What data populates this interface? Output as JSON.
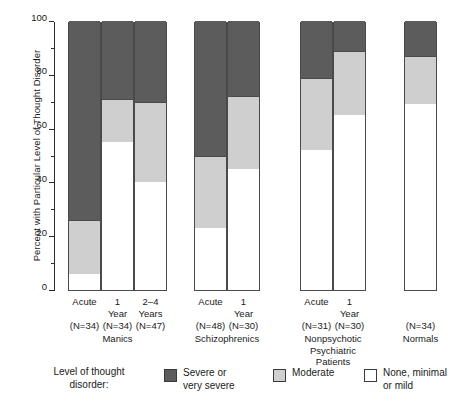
{
  "chart_data": {
    "type": "bar",
    "subtype": "stacked-100-percent",
    "title": "",
    "xlabel": "",
    "ylabel": "Percent with Particular Level of Thought Disorder",
    "ylim": [
      0,
      100
    ],
    "ytick_labels": [
      "0",
      "20",
      "40",
      "60",
      "80",
      "100"
    ],
    "ytick_values": [
      0,
      20,
      40,
      60,
      80,
      100
    ],
    "yminor_values": [
      10,
      30,
      50,
      70,
      90
    ],
    "grid": false,
    "legend_position": "bottom",
    "legend_title_line1": "Level of thought",
    "legend_title_line2": "disorder:",
    "series": [
      {
        "name": "Severe or very severe",
        "name_line1": "Severe or",
        "name_line2": "very severe",
        "color": "#5c5c5c",
        "values": [
          74,
          29,
          30,
          50,
          28,
          21,
          11,
          13
        ]
      },
      {
        "name": "Moderate",
        "name_line1": "Moderate",
        "name_line2": "",
        "color": "#cfcfcf",
        "values": [
          20,
          16,
          30,
          27,
          27,
          27,
          24,
          18
        ]
      },
      {
        "name": "None, minimal or mild",
        "name_line1": "None, minimal",
        "name_line2": "or mild",
        "color": "#ffffff",
        "values": [
          6,
          55,
          40,
          23,
          45,
          52,
          65,
          69
        ]
      }
    ],
    "categories": [
      {
        "line1": "Acute",
        "line2": "",
        "n": "(N=34)"
      },
      {
        "line1": "1",
        "line2": "Year",
        "n": "(N=34)"
      },
      {
        "line1": "2–4",
        "line2": "Years",
        "n": "(N=47)"
      },
      {
        "line1": "Acute",
        "line2": "",
        "n": "(N=48)"
      },
      {
        "line1": "1",
        "line2": "Year",
        "n": "(N=30)"
      },
      {
        "line1": "Acute",
        "line2": "",
        "n": "(N=31)"
      },
      {
        "line1": "1",
        "line2": "Year",
        "n": "(N=30)"
      },
      {
        "line1": "",
        "line2": "",
        "n": "(N=34)"
      }
    ],
    "groups": [
      {
        "lines": [
          "Manics"
        ],
        "bars": [
          0,
          1,
          2
        ]
      },
      {
        "lines": [
          "Schizophrenics"
        ],
        "bars": [
          3,
          4
        ]
      },
      {
        "lines": [
          "Nonpsychotic",
          "Psychiatric",
          "Patients"
        ],
        "bars": [
          5,
          6
        ]
      },
      {
        "lines": [
          "Normals"
        ],
        "bars": [
          7
        ]
      }
    ]
  }
}
